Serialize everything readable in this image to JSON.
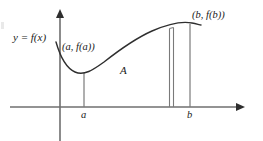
{
  "figure": {
    "labels": {
      "function": "y = f(x)",
      "point_a": "(a, f(a))",
      "point_b": "(b, f(b))",
      "area": "A",
      "tick_a": "a",
      "tick_b": "b"
    },
    "colors": {
      "curve": "#3b3b3b",
      "axis": "#6f6f6f",
      "rect": "#8a8a8a",
      "text": "#1a1a1a",
      "background": "#ffffff"
    },
    "geometry": {
      "x_axis": {
        "y": 107,
        "x_start": 10,
        "x_end": 243
      },
      "y_axis": {
        "x": 60,
        "y_top": 12,
        "y_bottom": 141
      },
      "a": {
        "x": 84,
        "fa_y": 73
      },
      "b": {
        "x": 190,
        "fb_y": 24
      },
      "rect_strip": {
        "x_left": 169,
        "x_right": 174,
        "y_top": 27
      }
    }
  }
}
